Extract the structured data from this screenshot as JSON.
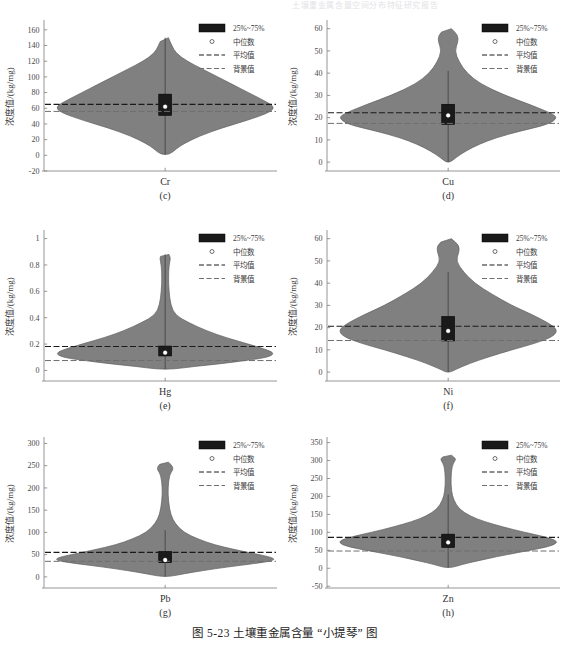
{
  "running_header": "土壤重金属含量空间分布特征研究报告",
  "caption": "图 5-23  土壤重金属含量 “小提琴” 图",
  "legend": {
    "box_label": "25%~75%",
    "median_label": "中位数",
    "mean_label": "平均值",
    "background_label": "背景值"
  },
  "axis": {
    "ylabel": "浓度值/(kg/mg)"
  },
  "colors": {
    "violin_fill": "#808080",
    "violin_stroke": "#5e5e5e",
    "box_fill": "#1a1a1a",
    "median_dot": "#ffffff",
    "mean_line": "#1a1a1a",
    "background_line": "#6e6e6e",
    "axis": "#8a8a8a",
    "text": "#333333"
  },
  "chart_data": [
    {
      "type": "violin",
      "panel": "(c)",
      "category": "Cr",
      "title": "",
      "xlabel": "Cr",
      "ylabel": "浓度值/(kg/mg)",
      "ylim": [
        -20,
        170
      ],
      "yticks": [
        -20,
        0,
        20,
        40,
        60,
        80,
        100,
        120,
        140,
        160
      ],
      "grid": false,
      "legend_position": "top-right",
      "median": 62,
      "q1": 51,
      "q3": 78,
      "whisker_low": 1,
      "whisker_high": 150,
      "mean": 65,
      "background_value": 56,
      "density_profile": [
        {
          "y": 150,
          "w": 0.03
        },
        {
          "y": 140,
          "w": 0.06
        },
        {
          "y": 130,
          "w": 0.1
        },
        {
          "y": 120,
          "w": 0.2
        },
        {
          "y": 110,
          "w": 0.34
        },
        {
          "y": 100,
          "w": 0.48
        },
        {
          "y": 90,
          "w": 0.62
        },
        {
          "y": 80,
          "w": 0.76
        },
        {
          "y": 70,
          "w": 0.9
        },
        {
          "y": 62,
          "w": 1.0
        },
        {
          "y": 55,
          "w": 0.96
        },
        {
          "y": 45,
          "w": 0.76
        },
        {
          "y": 35,
          "w": 0.52
        },
        {
          "y": 25,
          "w": 0.32
        },
        {
          "y": 15,
          "w": 0.17
        },
        {
          "y": 8,
          "w": 0.1
        },
        {
          "y": 1,
          "w": 0.04
        }
      ]
    },
    {
      "type": "violin",
      "panel": "(d)",
      "category": "Cu",
      "title": "",
      "xlabel": "Cu",
      "ylabel": "浓度值/(kg/mg)",
      "ylim": [
        -4,
        63
      ],
      "yticks": [
        0,
        10,
        20,
        30,
        40,
        50,
        60
      ],
      "grid": false,
      "legend_position": "top-right",
      "median": 21,
      "q1": 17,
      "q3": 26,
      "whisker_low": 0,
      "whisker_high": 41,
      "mean": 22.2,
      "background_value": 17.4,
      "density_profile": [
        {
          "y": 60,
          "w": 0.03
        },
        {
          "y": 57,
          "w": 0.09
        },
        {
          "y": 54,
          "w": 0.09
        },
        {
          "y": 50,
          "w": 0.06
        },
        {
          "y": 45,
          "w": 0.1
        },
        {
          "y": 40,
          "w": 0.17
        },
        {
          "y": 35,
          "w": 0.3
        },
        {
          "y": 30,
          "w": 0.52
        },
        {
          "y": 26,
          "w": 0.74
        },
        {
          "y": 22,
          "w": 0.94
        },
        {
          "y": 20,
          "w": 1.0
        },
        {
          "y": 17,
          "w": 0.92
        },
        {
          "y": 14,
          "w": 0.66
        },
        {
          "y": 11,
          "w": 0.44
        },
        {
          "y": 8,
          "w": 0.28
        },
        {
          "y": 5,
          "w": 0.16
        },
        {
          "y": 2,
          "w": 0.07
        },
        {
          "y": 0,
          "w": 0.02
        }
      ]
    },
    {
      "type": "violin",
      "panel": "(e)",
      "category": "Hg",
      "title": "",
      "xlabel": "Hg",
      "ylabel": "浓度值/(kg/mg)",
      "ylim": [
        -0.08,
        1.05
      ],
      "yticks": [
        0,
        0.2,
        0.4,
        0.6,
        0.8,
        1.0
      ],
      "grid": false,
      "legend_position": "top-right",
      "median": 0.135,
      "q1": 0.11,
      "q3": 0.185,
      "whisker_low": 0.01,
      "whisker_high": 0.88,
      "mean": 0.182,
      "background_value": 0.075,
      "density_profile": [
        {
          "y": 0.88,
          "w": 0.035
        },
        {
          "y": 0.85,
          "w": 0.05
        },
        {
          "y": 0.8,
          "w": 0.035
        },
        {
          "y": 0.7,
          "w": 0.03
        },
        {
          "y": 0.6,
          "w": 0.035
        },
        {
          "y": 0.5,
          "w": 0.05
        },
        {
          "y": 0.42,
          "w": 0.09
        },
        {
          "y": 0.36,
          "w": 0.22
        },
        {
          "y": 0.3,
          "w": 0.38
        },
        {
          "y": 0.25,
          "w": 0.55
        },
        {
          "y": 0.2,
          "w": 0.76
        },
        {
          "y": 0.16,
          "w": 0.92
        },
        {
          "y": 0.13,
          "w": 1.0
        },
        {
          "y": 0.1,
          "w": 0.94
        },
        {
          "y": 0.08,
          "w": 0.78
        },
        {
          "y": 0.05,
          "w": 0.5
        },
        {
          "y": 0.03,
          "w": 0.26
        },
        {
          "y": 0.01,
          "w": 0.08
        }
      ]
    },
    {
      "type": "violin",
      "panel": "(f)",
      "category": "Ni",
      "title": "",
      "xlabel": "Ni",
      "ylabel": "浓度值/(kg/mg)",
      "ylim": [
        -4,
        63
      ],
      "yticks": [
        0,
        10,
        20,
        30,
        40,
        50,
        60
      ],
      "grid": false,
      "legend_position": "top-right",
      "median": 18.5,
      "q1": 14,
      "q3": 25,
      "whisker_low": 0,
      "whisker_high": 45,
      "mean": 20.6,
      "background_value": 14.2,
      "density_profile": [
        {
          "y": 60,
          "w": 0.03
        },
        {
          "y": 57,
          "w": 0.1
        },
        {
          "y": 54,
          "w": 0.1
        },
        {
          "y": 50,
          "w": 0.07
        },
        {
          "y": 45,
          "w": 0.14
        },
        {
          "y": 40,
          "w": 0.24
        },
        {
          "y": 35,
          "w": 0.4
        },
        {
          "y": 30,
          "w": 0.58
        },
        {
          "y": 26,
          "w": 0.76
        },
        {
          "y": 22,
          "w": 0.92
        },
        {
          "y": 19,
          "w": 1.0
        },
        {
          "y": 16,
          "w": 0.96
        },
        {
          "y": 13,
          "w": 0.8
        },
        {
          "y": 10,
          "w": 0.58
        },
        {
          "y": 7,
          "w": 0.38
        },
        {
          "y": 4,
          "w": 0.2
        },
        {
          "y": 1,
          "w": 0.06
        },
        {
          "y": 0,
          "w": 0.02
        }
      ]
    },
    {
      "type": "violin",
      "panel": "(g)",
      "category": "Pb",
      "title": "",
      "xlabel": "Pb",
      "ylabel": "浓度值/(kg/mg)",
      "ylim": [
        -25,
        310
      ],
      "yticks": [
        0,
        50,
        100,
        150,
        200,
        250,
        300
      ],
      "grid": false,
      "legend_position": "top-right",
      "median": 38,
      "q1": 32,
      "q3": 57,
      "whisker_low": 1,
      "whisker_high": 105,
      "mean": 55,
      "background_value": 35,
      "density_profile": [
        {
          "y": 258,
          "w": 0.03
        },
        {
          "y": 248,
          "w": 0.07
        },
        {
          "y": 240,
          "w": 0.07
        },
        {
          "y": 230,
          "w": 0.04
        },
        {
          "y": 200,
          "w": 0.025
        },
        {
          "y": 170,
          "w": 0.03
        },
        {
          "y": 140,
          "w": 0.05
        },
        {
          "y": 120,
          "w": 0.09
        },
        {
          "y": 100,
          "w": 0.17
        },
        {
          "y": 85,
          "w": 0.3
        },
        {
          "y": 72,
          "w": 0.45
        },
        {
          "y": 60,
          "w": 0.66
        },
        {
          "y": 50,
          "w": 0.86
        },
        {
          "y": 42,
          "w": 1.0
        },
        {
          "y": 36,
          "w": 0.98
        },
        {
          "y": 30,
          "w": 0.82
        },
        {
          "y": 22,
          "w": 0.56
        },
        {
          "y": 14,
          "w": 0.34
        },
        {
          "y": 7,
          "w": 0.17
        },
        {
          "y": 1,
          "w": 0.05
        }
      ]
    },
    {
      "type": "violin",
      "panel": "(h)",
      "category": "Zn",
      "title": "",
      "xlabel": "Zn",
      "ylabel": "浓度值/(kg/mg)",
      "ylim": [
        -55,
        360
      ],
      "yticks": [
        -50,
        0,
        50,
        100,
        150,
        200,
        250,
        300,
        350
      ],
      "grid": false,
      "legend_position": "top-right",
      "median": 72,
      "q1": 58,
      "q3": 95,
      "whisker_low": 2,
      "whisker_high": 205,
      "mean": 86,
      "background_value": 48,
      "density_profile": [
        {
          "y": 315,
          "w": 0.03
        },
        {
          "y": 305,
          "w": 0.07
        },
        {
          "y": 298,
          "w": 0.06
        },
        {
          "y": 285,
          "w": 0.035
        },
        {
          "y": 250,
          "w": 0.025
        },
        {
          "y": 215,
          "w": 0.03
        },
        {
          "y": 190,
          "w": 0.05
        },
        {
          "y": 165,
          "w": 0.1
        },
        {
          "y": 145,
          "w": 0.2
        },
        {
          "y": 130,
          "w": 0.33
        },
        {
          "y": 115,
          "w": 0.5
        },
        {
          "y": 100,
          "w": 0.7
        },
        {
          "y": 88,
          "w": 0.88
        },
        {
          "y": 76,
          "w": 1.0
        },
        {
          "y": 65,
          "w": 0.97
        },
        {
          "y": 55,
          "w": 0.84
        },
        {
          "y": 44,
          "w": 0.64
        },
        {
          "y": 32,
          "w": 0.44
        },
        {
          "y": 20,
          "w": 0.26
        },
        {
          "y": 10,
          "w": 0.12
        },
        {
          "y": 2,
          "w": 0.04
        }
      ]
    }
  ]
}
